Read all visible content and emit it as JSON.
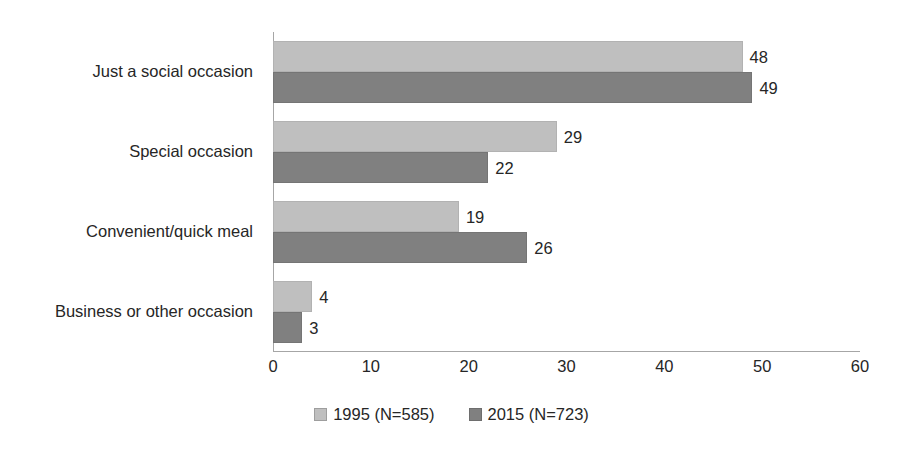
{
  "chart_data": {
    "type": "bar",
    "orientation": "horizontal",
    "title": "",
    "subtitle": "",
    "xlabel": "",
    "ylabel": "",
    "xlim": [
      0,
      60
    ],
    "xticks": [
      0,
      10,
      20,
      30,
      40,
      50,
      60
    ],
    "xtick_labels": [
      "0",
      "10",
      "20",
      "30",
      "40",
      "50",
      "60"
    ],
    "grid": false,
    "legend_position": "bottom-center",
    "categories": [
      "Just a social occasion",
      "Special occasion",
      "Convenient/quick meal",
      "Business or other occasion"
    ],
    "series": [
      {
        "name": "1995 (N=585)",
        "color": "#bfbfbf",
        "values": [
          48,
          29,
          19,
          4
        ],
        "value_labels": [
          "48",
          "29",
          "19",
          "4"
        ]
      },
      {
        "name": "2015 (N=723)",
        "color": "#808080",
        "values": [
          49,
          22,
          26,
          3
        ],
        "value_labels": [
          "49",
          "22",
          "26",
          "3"
        ]
      }
    ]
  },
  "legend": {
    "items": [
      {
        "label": "1995 (N=585)",
        "swatch": "legend-swatch-1995"
      },
      {
        "label": "2015 (N=723)",
        "swatch": "legend-swatch-2015"
      }
    ]
  },
  "colors": {
    "series_1995": "#bfbfbf",
    "series_2015": "#808080",
    "axis": "#a6a6a6",
    "text": "#262626",
    "background": "#ffffff"
  }
}
